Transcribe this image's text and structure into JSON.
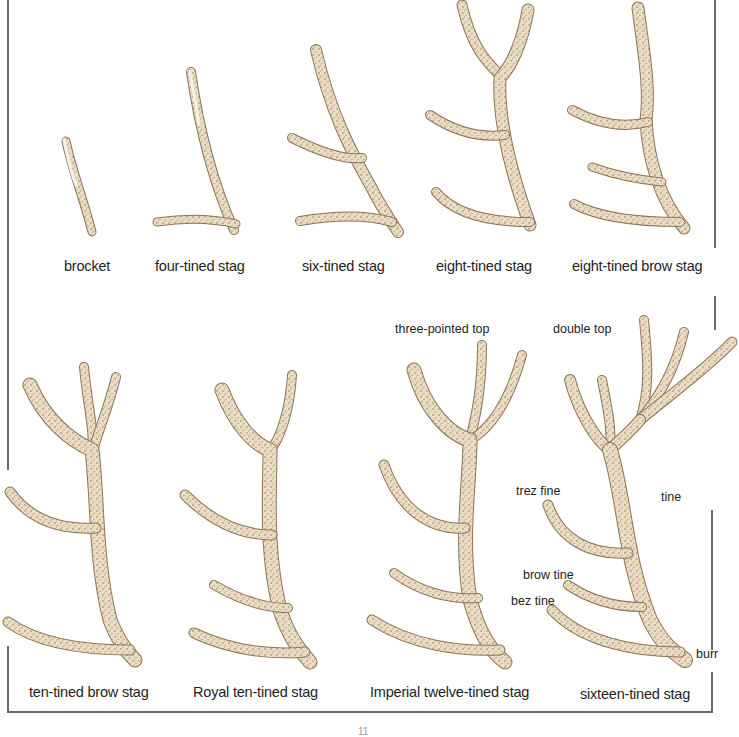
{
  "plate": {
    "top_row": [
      {
        "label": "brocket"
      },
      {
        "label": "four-tined stag"
      },
      {
        "label": "six-tined stag"
      },
      {
        "label": "eight-tined stag"
      },
      {
        "label": "eight-tined brow stag"
      }
    ],
    "bottom_row": [
      {
        "label": "ten-tined brow stag"
      },
      {
        "label": "Royal ten-tined stag"
      },
      {
        "label": "Imperial twelve-tined stag"
      },
      {
        "label": "sixteen-tined stag"
      }
    ],
    "annotations": {
      "three_pointed_top": "three-pointed top",
      "double_top": "double top",
      "trez_tine": "trez fine",
      "tine": "tine",
      "brow_tine": "brow tine",
      "bez_tine": "bez tine",
      "burr": "burr"
    },
    "colors": {
      "antler_light": "#efe6d2",
      "antler_mid": "#cdb99a",
      "antler_dark": "#7a5a38",
      "rule": "#6a6a6a"
    }
  },
  "footer": {
    "page_number": "11"
  }
}
